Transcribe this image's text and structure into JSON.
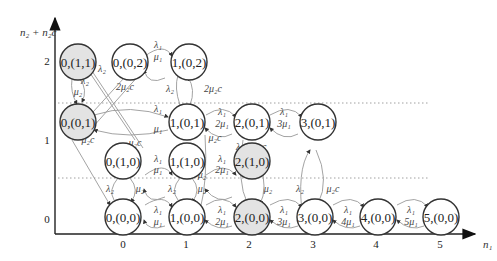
{
  "axes": {
    "y_label": "n₂ + n₂c",
    "x_label": "n₁",
    "y_ticks": [
      "2",
      "1",
      "0"
    ],
    "x_ticks": [
      "0",
      "1",
      "2",
      "3",
      "4",
      "5"
    ]
  },
  "colors": {
    "shaded_state": "#e3e3e3",
    "normal_state": "#ffffff",
    "edge": "#999999"
  },
  "states": [
    {
      "id": "s011",
      "label": "0,(1,1)",
      "shaded": true
    },
    {
      "id": "s002",
      "label": "0,(0,2)",
      "shaded": false
    },
    {
      "id": "s102",
      "label": "1,(0,2)",
      "shaded": false
    },
    {
      "id": "s001",
      "label": "0,(0,1)",
      "shaded": true
    },
    {
      "id": "s101",
      "label": "1,(0,1)",
      "shaded": false
    },
    {
      "id": "s201",
      "label": "2,(0,1)",
      "shaded": false
    },
    {
      "id": "s301",
      "label": "3,(0,1)",
      "shaded": false
    },
    {
      "id": "s010",
      "label": "0,(1,0)",
      "shaded": false
    },
    {
      "id": "s110",
      "label": "1,(1,0)",
      "shaded": false
    },
    {
      "id": "s210",
      "label": "2,(1,0)",
      "shaded": true
    },
    {
      "id": "s000",
      "label": "0,(0,0)",
      "shaded": false
    },
    {
      "id": "s100",
      "label": "1,(0,0)",
      "shaded": false
    },
    {
      "id": "s200",
      "label": "2,(0,0)",
      "shaded": true
    },
    {
      "id": "s300",
      "label": "3,(0,0)",
      "shaded": false
    },
    {
      "id": "s400",
      "label": "4,(0,0)",
      "shaded": false
    },
    {
      "id": "s500",
      "label": "5,(0,0)",
      "shaded": false
    }
  ],
  "rates": {
    "l1": "λ₁",
    "l2": "λ₂",
    "m1": "μ₁",
    "m2": "μ₂",
    "m2c": "μ₂c",
    "2m1": "2μ₁",
    "3m1": "3μ₁",
    "4m1": "4μ₁",
    "5m1": "5μ₁",
    "2m2c": "2μ₂c"
  }
}
